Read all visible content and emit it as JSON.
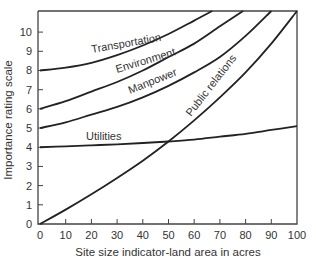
{
  "chart_data": {
    "type": "line",
    "title": "",
    "xlabel": "Site size indicator-land area in acres",
    "ylabel": "Importance rating scale",
    "xlim": [
      0,
      100
    ],
    "ylim": [
      0,
      11.1
    ],
    "x_ticks": [
      0,
      10,
      20,
      30,
      40,
      50,
      60,
      70,
      80,
      90,
      100
    ],
    "y_ticks": [
      0,
      1,
      2,
      3,
      4,
      5,
      6,
      7,
      8,
      9,
      10
    ],
    "grid": false,
    "legend": "inline labels on curves",
    "series": [
      {
        "name": "Transportation",
        "x": [
          0,
          10,
          20,
          30,
          40,
          50,
          60,
          67
        ],
        "y": [
          8.0,
          8.15,
          8.4,
          8.8,
          9.3,
          9.9,
          10.6,
          11.1
        ]
      },
      {
        "name": "Environment",
        "x": [
          0,
          10,
          20,
          30,
          40,
          50,
          60,
          70,
          79
        ],
        "y": [
          6.0,
          6.4,
          6.9,
          7.4,
          8.0,
          8.7,
          9.4,
          10.3,
          11.1
        ]
      },
      {
        "name": "Manpower",
        "x": [
          0,
          10,
          20,
          30,
          40,
          50,
          60,
          70,
          80,
          90
        ],
        "y": [
          5.0,
          5.3,
          5.7,
          6.1,
          6.6,
          7.2,
          7.9,
          8.7,
          9.8,
          11.1
        ]
      },
      {
        "name": "Utilities",
        "x": [
          0,
          10,
          20,
          30,
          40,
          50,
          60,
          70,
          80,
          90,
          100
        ],
        "y": [
          4.0,
          4.05,
          4.1,
          4.15,
          4.22,
          4.3,
          4.4,
          4.55,
          4.7,
          4.9,
          5.1
        ]
      },
      {
        "name": "Public relations",
        "x": [
          0,
          10,
          20,
          30,
          40,
          50,
          60,
          70,
          80,
          90,
          100
        ],
        "y": [
          0.0,
          0.75,
          1.55,
          2.4,
          3.3,
          4.3,
          5.4,
          6.6,
          7.9,
          9.4,
          11.1
        ]
      }
    ]
  },
  "labels": {
    "transportation": "Transportation",
    "environment": "Environment",
    "manpower": "Manpower",
    "utilities": "Utilities",
    "public_relations": "Public relations"
  }
}
